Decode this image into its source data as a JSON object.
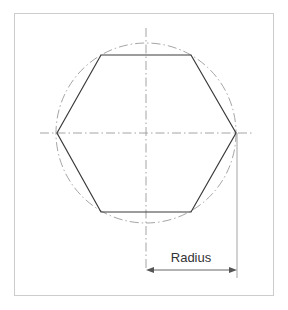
{
  "figure": {
    "background_color": "#ffffff",
    "frame": {
      "name": "figure-border",
      "x": 14,
      "y": 13,
      "width": 260,
      "height": 283,
      "stroke_color": "#cccccc",
      "stroke_width": 1,
      "fill": "#ffffff"
    },
    "labels": {
      "radius_label": "Radius"
    },
    "colors": {
      "outline": "#3a3a3a",
      "construction": "#9a9a9a",
      "dimension": "#555555",
      "text": "#333333",
      "frame": "#cccccc"
    }
  },
  "chart_data": {
    "type": "diagram",
    "center": {
      "x": 146,
      "y": 133
    },
    "circle": {
      "name": "construction-circle",
      "cx": 146,
      "cy": 133,
      "r": 90,
      "line_style": "dash-dot",
      "stroke_color": "#9a9a9a"
    },
    "hexagon": {
      "name": "hexagon-outline",
      "orientation": "flat-top",
      "circumradius": 90,
      "sides": 6,
      "stroke_color": "#3a3a3a",
      "stroke_width": 1.2,
      "fill": "none",
      "vertices": [
        {
          "label": "left",
          "x": 57,
          "y": 133
        },
        {
          "label": "top-left",
          "x": 101,
          "y": 55
        },
        {
          "label": "top-right",
          "x": 191,
          "y": 55
        },
        {
          "label": "right",
          "x": 236,
          "y": 133
        },
        {
          "label": "bottom-right",
          "x": 191,
          "y": 212
        },
        {
          "label": "bottom-left",
          "x": 101,
          "y": 212
        }
      ]
    },
    "centerlines": [
      {
        "name": "horizontal-centerline",
        "orientation": "horizontal",
        "x1": 40,
        "y1": 133,
        "x2": 252,
        "y2": 133,
        "line_style": "dash-dot",
        "stroke_color": "#9a9a9a"
      },
      {
        "name": "vertical-centerline",
        "orientation": "vertical",
        "x1": 146,
        "y1": 28,
        "x2": 146,
        "y2": 268,
        "line_style": "dash-dot",
        "stroke_color": "#9a9a9a"
      }
    ],
    "dimension": {
      "name": "radius-dimension",
      "label": "Radius",
      "measures": "circumradius",
      "value_px": 91,
      "arrow_y": 270,
      "from_x": 146,
      "to_x": 237,
      "double_headed": true,
      "extension_line": {
        "name": "right-extension-line",
        "x1": 237,
        "y1": 133,
        "x2": 237,
        "y2": 278,
        "stroke_color": "#9a9a9a"
      },
      "text_position": {
        "x": 191,
        "y": 262
      },
      "stroke_color": "#555555"
    },
    "xlabel": "",
    "ylabel": "",
    "grid": false,
    "legend": false
  }
}
